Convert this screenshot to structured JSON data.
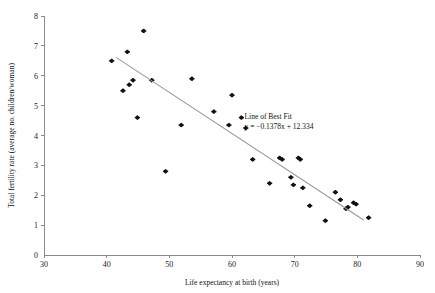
{
  "chart_data": {
    "type": "scatter",
    "title": "",
    "xlabel": "Life expectancy at birth (years)",
    "ylabel": "Total fertility rate (average no. children/woman)",
    "xlim": [
      30,
      90
    ],
    "ylim": [
      0,
      8
    ],
    "xticks": [
      30,
      40,
      50,
      60,
      70,
      80,
      90
    ],
    "yticks": [
      1,
      2,
      3,
      4,
      5,
      6,
      7,
      8
    ],
    "xtick_labels": [
      "30",
      "40",
      "50",
      "60",
      "70",
      "80",
      "90"
    ],
    "ytick_labels": [
      "1",
      "2",
      "3",
      "4",
      "5",
      "6",
      "7",
      "8"
    ],
    "grid": false,
    "legend": "none",
    "points": [
      [
        40.8,
        6.5
      ],
      [
        42.6,
        5.5
      ],
      [
        43.3,
        6.8
      ],
      [
        43.6,
        5.7
      ],
      [
        44.2,
        5.85
      ],
      [
        44.9,
        4.6
      ],
      [
        45.9,
        7.5
      ],
      [
        47.2,
        5.85
      ],
      [
        49.4,
        2.8
      ],
      [
        51.9,
        4.35
      ],
      [
        53.6,
        5.9
      ],
      [
        57.1,
        4.8
      ],
      [
        59.5,
        4.35
      ],
      [
        60.0,
        5.35
      ],
      [
        61.5,
        4.6
      ],
      [
        62.2,
        4.25
      ],
      [
        63.3,
        3.2
      ],
      [
        66.0,
        2.4
      ],
      [
        67.6,
        3.25
      ],
      [
        68.0,
        3.2
      ],
      [
        69.4,
        2.6
      ],
      [
        69.8,
        2.35
      ],
      [
        70.6,
        3.25
      ],
      [
        70.9,
        3.2
      ],
      [
        71.3,
        2.25
      ],
      [
        72.4,
        1.65
      ],
      [
        74.9,
        1.15
      ],
      [
        76.5,
        2.1
      ],
      [
        77.3,
        1.85
      ],
      [
        78.2,
        1.55
      ],
      [
        78.5,
        1.6
      ],
      [
        79.4,
        1.75
      ],
      [
        79.8,
        1.7
      ],
      [
        81.8,
        1.25
      ]
    ],
    "trendline": {
      "label": "Line of Best Fit",
      "equation": "y = −0.1378x + 12.334",
      "slope": -0.1378,
      "intercept": 12.334,
      "x_start": 41.5,
      "x_end": 81.0,
      "color": "#9a9a9a"
    },
    "annotation": {
      "line1": "Line of Best Fit",
      "line2": "y = −0.1378x + 12.334",
      "x": 62.0,
      "y": 4.55
    },
    "marker_color": "#111111",
    "axis_color": "#8a8a8a"
  }
}
